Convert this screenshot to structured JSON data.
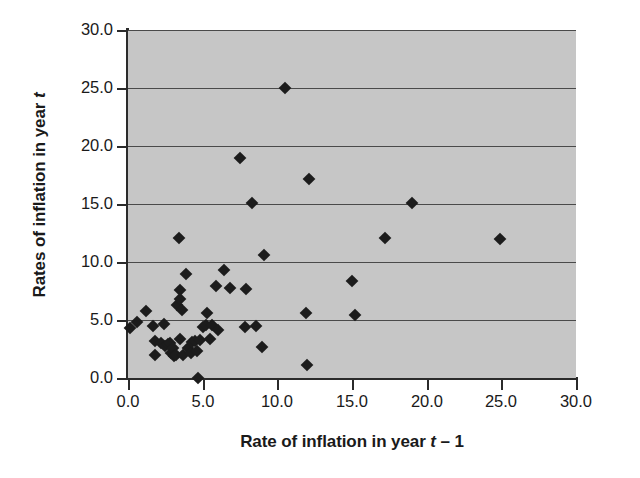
{
  "chart_data": {
    "type": "scatter",
    "title": "",
    "xlabel_parts": {
      "pre": "Rate of inflation in year ",
      "italic": "t",
      "post": " – 1"
    },
    "ylabel_parts": {
      "pre": "Rates of inflation in year ",
      "italic": "t",
      "post": ""
    },
    "xlabel": "Rate of inflation in year t – 1",
    "ylabel": "Rates of inflation in year t",
    "xlim": [
      0.0,
      30.0
    ],
    "ylim": [
      0.0,
      30.0
    ],
    "xticks": [
      "0.0",
      "5.0",
      "10.0",
      "15.0",
      "20.0",
      "25.0",
      "30.0"
    ],
    "xtick_values": [
      0,
      5,
      10,
      15,
      20,
      25,
      30
    ],
    "yticks": [
      "0.0",
      "5.0",
      "10.0",
      "15.0",
      "20.0",
      "25.0",
      "30.0"
    ],
    "ytick_values": [
      0,
      5,
      10,
      15,
      20,
      25,
      30
    ],
    "grid": "horizontal",
    "plot_background": "#c6c6c6",
    "marker": "diamond",
    "marker_color": "#1c1c1c",
    "legend": "none",
    "points": [
      [
        0.1,
        4.3
      ],
      [
        0.6,
        4.8
      ],
      [
        1.2,
        5.8
      ],
      [
        1.7,
        4.5
      ],
      [
        1.8,
        3.2
      ],
      [
        1.8,
        2.0
      ],
      [
        2.2,
        3.0
      ],
      [
        2.4,
        4.7
      ],
      [
        2.5,
        2.8
      ],
      [
        2.7,
        2.9
      ],
      [
        2.8,
        3.0
      ],
      [
        2.9,
        2.2
      ],
      [
        3.0,
        2.6
      ],
      [
        3.1,
        1.9
      ],
      [
        3.2,
        2.0
      ],
      [
        3.3,
        6.3
      ],
      [
        3.4,
        12.1
      ],
      [
        3.5,
        7.6
      ],
      [
        3.5,
        6.8
      ],
      [
        3.5,
        3.4
      ],
      [
        3.6,
        5.9
      ],
      [
        3.7,
        2.0
      ],
      [
        3.9,
        9.0
      ],
      [
        4.0,
        2.6
      ],
      [
        4.2,
        2.2
      ],
      [
        4.3,
        3.1
      ],
      [
        4.5,
        3.2
      ],
      [
        4.6,
        2.3
      ],
      [
        4.7,
        0.0
      ],
      [
        4.8,
        3.3
      ],
      [
        5.0,
        4.4
      ],
      [
        5.2,
        4.6
      ],
      [
        5.3,
        5.6
      ],
      [
        5.5,
        3.4
      ],
      [
        5.6,
        4.6
      ],
      [
        5.9,
        7.9
      ],
      [
        6.0,
        4.1
      ],
      [
        6.4,
        9.3
      ],
      [
        6.8,
        7.8
      ],
      [
        7.5,
        19.0
      ],
      [
        7.8,
        4.4
      ],
      [
        7.9,
        7.7
      ],
      [
        8.3,
        15.1
      ],
      [
        8.6,
        4.5
      ],
      [
        9.0,
        2.7
      ],
      [
        9.1,
        10.6
      ],
      [
        10.5,
        25.0
      ],
      [
        11.9,
        5.6
      ],
      [
        12.0,
        1.1
      ],
      [
        12.1,
        17.2
      ],
      [
        15.0,
        8.4
      ],
      [
        15.2,
        5.4
      ],
      [
        17.2,
        12.1
      ],
      [
        19.0,
        15.1
      ],
      [
        24.9,
        12.0
      ]
    ]
  }
}
